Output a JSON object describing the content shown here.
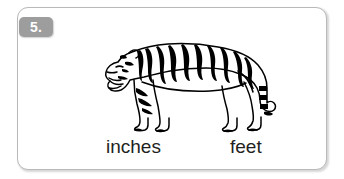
{
  "card": {
    "question_number": "5.",
    "border_color": "#b9b9b9",
    "badge_color": "#9d9d9d",
    "badge_text_color": "#ffffff",
    "background_color": "#ffffff"
  },
  "illustration": {
    "icon_name": "tiger-illustration",
    "description": "tiger",
    "line_color": "#000000",
    "fill_color": "#ffffff"
  },
  "answers": {
    "option_a": "inches",
    "option_b": "feet",
    "text_color": "#231f20"
  }
}
